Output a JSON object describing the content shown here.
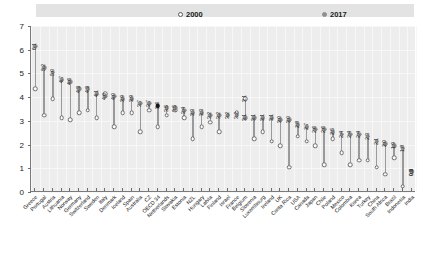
{
  "legend": {
    "items": [
      {
        "label": "2000",
        "marker": "hollow-circle-icon",
        "color": "#ffffff"
      },
      {
        "label": "2017",
        "marker": "solid-circle-icon",
        "color": "#8e8e8e"
      }
    ]
  },
  "axes": {
    "y_ticks": [
      "0",
      "1",
      "2",
      "3",
      "4",
      "5",
      "6",
      "7"
    ],
    "y_min": 0,
    "y_max": 7,
    "x_label": "",
    "y_label": ""
  },
  "highlight": {
    "category": "OECD 34",
    "color": "#141414"
  },
  "chart_data": {
    "type": "line",
    "title": "",
    "subtitle": "",
    "xlabel": "",
    "ylabel": "",
    "ylim": [
      0,
      7
    ],
    "grid": true,
    "legend_position": "top",
    "categories": [
      "Greece",
      "Portugal",
      "Austria",
      "Lithuania",
      "Norway",
      "Germany",
      "Switzerland",
      "Sweden",
      "Italy",
      "Denmark",
      "Iceland",
      "Spain",
      "Australia",
      "CZ",
      "OECD 34",
      "Netherlands",
      "Slovakia",
      "Estonia",
      "NZL",
      "Hungary",
      "Latvia",
      "Finland",
      "Israel",
      "France",
      "Belgium",
      "Slovenia",
      "Luxembourg",
      "Ireland",
      "UK",
      "Costa Rica",
      "USA",
      "Canada",
      "Japan",
      "Chile",
      "Poland",
      "Mexico",
      "Colombia",
      "Korea",
      "Turkey",
      "China",
      "South Africa",
      "Brazil",
      "Indonesia",
      "India"
    ],
    "series": [
      {
        "name": "2017",
        "marker": "solid-circle",
        "color": "#8e8e8e",
        "values": [
          6.1,
          5.2,
          5.0,
          4.7,
          4.6,
          4.3,
          4.3,
          4.1,
          4.0,
          4.0,
          3.9,
          3.9,
          3.7,
          3.7,
          3.6,
          3.5,
          3.5,
          3.4,
          3.3,
          3.3,
          3.2,
          3.2,
          3.2,
          3.2,
          3.1,
          3.1,
          3.1,
          3.1,
          3.0,
          3.0,
          2.8,
          2.7,
          2.6,
          2.6,
          2.5,
          2.4,
          2.4,
          2.4,
          2.3,
          2.1,
          2.0,
          1.9,
          1.8,
          0.8
        ],
        "labels": [
          "6.1",
          "5.2",
          "5.0",
          "4.7",
          "4.6",
          "4.3",
          "4.3",
          "4.1",
          "4.0",
          "4.0",
          "3.9",
          "3.9",
          "3.7",
          "3.7",
          "3.6",
          "3.5",
          "3.5",
          "3.4",
          "3.3",
          "3.3",
          "3.2",
          "3.2",
          "3.2",
          "3.2",
          "3.1",
          "3.1",
          "3.1",
          "3.1",
          "3.0",
          "3.0",
          "2.8",
          "2.7",
          "2.6",
          "2.6",
          "2.5",
          "2.4",
          "2.4",
          "2.4",
          "2.3",
          "2.1",
          "2.0",
          "1.9",
          "1.8",
          "0.8"
        ]
      },
      {
        "name": "2000",
        "marker": "hollow-circle",
        "color": "#ffffff",
        "values": [
          4.3,
          3.2,
          3.9,
          3.1,
          3.0,
          3.3,
          3.4,
          3.1,
          4.1,
          2.7,
          3.3,
          3.3,
          2.5,
          3.4,
          2.7,
          3.2,
          3.4,
          3.1,
          2.2,
          2.7,
          2.9,
          2.5,
          3.2,
          3.3,
          3.9,
          2.2,
          2.5,
          2.1,
          1.9,
          1.0,
          2.3,
          2.1,
          1.9,
          1.1,
          2.2,
          1.6,
          1.1,
          1.3,
          1.3,
          1.0,
          0.7,
          1.4,
          0.2,
          0.8
        ],
        "labels": [
          "",
          "",
          "",
          "",
          "",
          "",
          "",
          "",
          "",
          "",
          "",
          "",
          "",
          "",
          "",
          "",
          "",
          "",
          "",
          "",
          "",
          "",
          "",
          "",
          "3.1",
          "",
          "",
          "",
          "",
          "",
          "",
          "",
          "",
          "",
          "",
          "",
          "",
          "",
          "",
          "",
          "",
          "",
          "",
          "0.3"
        ]
      }
    ]
  }
}
